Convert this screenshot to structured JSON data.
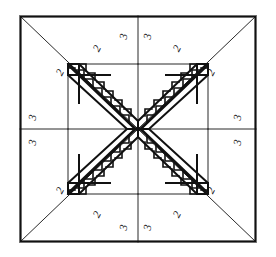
{
  "document": {
    "title": "Eight-Pointed Star Quilt Block Pattern",
    "type": "quilt-block-line-diagram",
    "canvas": {
      "width": 276,
      "height": 257
    },
    "ink_color": "#111111",
    "background_color": "#ffffff"
  },
  "block": {
    "name": "eight-pointed-star-with-sawtooth-border",
    "outer_frame": {
      "x": 20,
      "y": 16,
      "width": 236,
      "height": 226
    },
    "center_point": {
      "x": 138,
      "y": 129
    },
    "grid_divider_vertical_x": 138,
    "grid_divider_horizontal_y": 129,
    "star_points": 8,
    "sawtooth_bands": 8,
    "triangles_per_band": 7
  },
  "labels": {
    "patch_2": "2",
    "patch_3": "3",
    "items": [
      {
        "text": "2",
        "x": 63,
        "y": 74,
        "rotate": -62,
        "name": "patch-label-2-top-left-outer"
      },
      {
        "text": "2",
        "x": 100,
        "y": 50,
        "rotate": -62,
        "name": "patch-label-2-top-left-inner"
      },
      {
        "text": "3",
        "x": 127,
        "y": 37,
        "rotate": -80,
        "name": "patch-label-3-top-left-of-center"
      },
      {
        "text": "3",
        "x": 151,
        "y": 37,
        "rotate": -80,
        "name": "patch-label-3-top-right-of-center"
      },
      {
        "text": "2",
        "x": 180,
        "y": 50,
        "rotate": -62,
        "name": "patch-label-2-top-right-inner"
      },
      {
        "text": "2",
        "x": 214,
        "y": 74,
        "rotate": -62,
        "name": "patch-label-2-top-right-outer"
      },
      {
        "text": "3",
        "x": 36,
        "y": 118,
        "rotate": -80,
        "name": "patch-label-3-left-upper"
      },
      {
        "text": "3",
        "x": 36,
        "y": 143,
        "rotate": -80,
        "name": "patch-label-3-left-lower"
      },
      {
        "text": "3",
        "x": 241,
        "y": 118,
        "rotate": -80,
        "name": "patch-label-3-right-upper"
      },
      {
        "text": "3",
        "x": 241,
        "y": 143,
        "rotate": -80,
        "name": "patch-label-3-right-lower"
      },
      {
        "text": "2",
        "x": 63,
        "y": 192,
        "rotate": -62,
        "name": "patch-label-2-bottom-left-outer"
      },
      {
        "text": "2",
        "x": 100,
        "y": 216,
        "rotate": -62,
        "name": "patch-label-2-bottom-left-inner"
      },
      {
        "text": "3",
        "x": 127,
        "y": 228,
        "rotate": -80,
        "name": "patch-label-3-bottom-left-of-center"
      },
      {
        "text": "3",
        "x": 151,
        "y": 228,
        "rotate": -80,
        "name": "patch-label-3-bottom-right-of-center"
      },
      {
        "text": "2",
        "x": 180,
        "y": 216,
        "rotate": -62,
        "name": "patch-label-2-bottom-right-inner"
      },
      {
        "text": "2",
        "x": 214,
        "y": 192,
        "rotate": -62,
        "name": "patch-label-2-bottom-right-outer"
      }
    ]
  },
  "geometry": {
    "frame": {
      "left": 20,
      "top": 16,
      "right": 256,
      "bottom": 242
    },
    "inner_square": {
      "left": 68,
      "top": 64,
      "right": 208,
      "bottom": 194
    },
    "corner_diagonals": [
      {
        "name": "diagonal-top-left",
        "x1": 20,
        "y1": 16,
        "x2": 138,
        "y2": 129
      },
      {
        "name": "diagonal-top-right",
        "x1": 256,
        "y1": 16,
        "x2": 138,
        "y2": 129
      },
      {
        "name": "diagonal-bottom-left",
        "x1": 20,
        "y1": 242,
        "x2": 138,
        "y2": 129
      },
      {
        "name": "diagonal-bottom-right",
        "x1": 256,
        "y1": 242,
        "x2": 138,
        "y2": 129
      }
    ],
    "center_spokes": [
      {
        "name": "spoke-up",
        "x2": 138,
        "y2": 16
      },
      {
        "name": "spoke-down",
        "x2": 138,
        "y2": 242
      },
      {
        "name": "spoke-left",
        "x2": 20,
        "y2": 129
      },
      {
        "name": "spoke-right",
        "x2": 256,
        "y2": 129
      }
    ],
    "sawtooth_geese": [
      {
        "name": "geese-band-n-left",
        "from": [
          79,
          64
        ],
        "to": [
          138,
          122
        ]
      },
      {
        "name": "geese-band-n-right",
        "from": [
          197,
          64
        ],
        "to": [
          138,
          122
        ]
      },
      {
        "name": "geese-band-w-top",
        "from": [
          68,
          75
        ],
        "to": [
          128,
          129
        ]
      },
      {
        "name": "geese-band-w-bot",
        "from": [
          68,
          183
        ],
        "to": [
          128,
          129
        ]
      },
      {
        "name": "geese-band-e-top",
        "from": [
          208,
          75
        ],
        "to": [
          148,
          129
        ]
      },
      {
        "name": "geese-band-e-bot",
        "from": [
          208,
          183
        ],
        "to": [
          148,
          129
        ]
      },
      {
        "name": "geese-band-s-left",
        "from": [
          79,
          194
        ],
        "to": [
          138,
          136
        ]
      },
      {
        "name": "geese-band-s-right",
        "from": [
          197,
          194
        ],
        "to": [
          138,
          136
        ]
      }
    ]
  }
}
